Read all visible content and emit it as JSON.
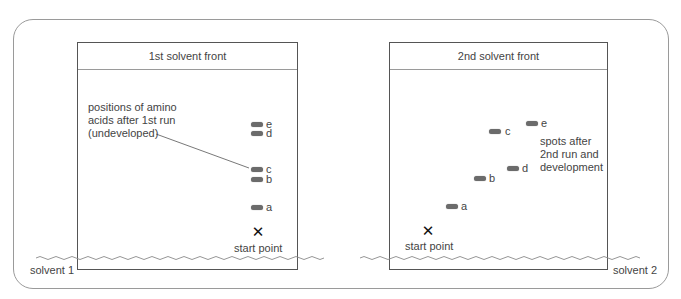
{
  "diagram": {
    "type": "two-dimensional paper chromatography",
    "left_panel": {
      "solvent_front_label": "1st solvent front",
      "solvent_label": "solvent 1",
      "annotation": "positions of amino\nacids after 1st run\n(undeveloped)",
      "start_label": "start point",
      "start_marker": "✕",
      "spots": [
        {
          "label": "e",
          "x": 251,
          "y": 122
        },
        {
          "label": "d",
          "x": 251,
          "y": 131
        },
        {
          "label": "c",
          "x": 251,
          "y": 167
        },
        {
          "label": "b",
          "x": 251,
          "y": 177
        },
        {
          "label": "a",
          "x": 251,
          "y": 205
        }
      ]
    },
    "right_panel": {
      "solvent_front_label": "2nd solvent front",
      "solvent_label": "solvent 2",
      "annotation": "spots after\n2nd run and\ndevelopment",
      "start_label": "start point",
      "start_marker": "✕",
      "spots": [
        {
          "label": "e",
          "x": 526,
          "y": 121
        },
        {
          "label": "c",
          "x": 489,
          "y": 129
        },
        {
          "label": "d",
          "x": 507,
          "y": 166
        },
        {
          "label": "b",
          "x": 474,
          "y": 176
        },
        {
          "label": "a",
          "x": 446,
          "y": 204
        }
      ]
    },
    "colors": {
      "border": "#555555",
      "outer_border": "#9a9a9a",
      "spot": "#6b6b6b",
      "text": "#444444"
    }
  }
}
